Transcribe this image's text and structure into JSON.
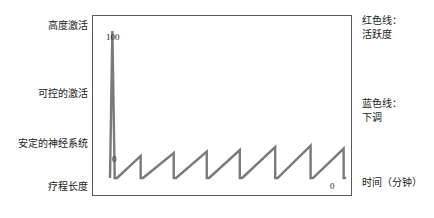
{
  "figure": {
    "title_visible": false,
    "background": "#ffffff",
    "frame_color": "#5a5a5a",
    "curve_color": "#7a7a7a"
  },
  "axis_labels": {
    "y_max": "100",
    "y_min": "0",
    "x_end": "0"
  },
  "left_labels": [
    {
      "text": "高度激活"
    },
    {
      "text": "可控的激活"
    },
    {
      "text": "安定的神经系统"
    },
    {
      "text": "疗程长度"
    }
  ],
  "right_labels": [
    {
      "text": "红色线：\n活跃度"
    },
    {
      "text": "蓝色线：\n下调"
    },
    {
      "text": "时间（分钟）"
    }
  ],
  "right_labels_flat": {
    "legend_red": "红色线：",
    "legend_red_value": "活跃度",
    "legend_blue": "蓝色线：",
    "legend_blue_value": "下调",
    "x_axis_title": "时间（分钟）"
  },
  "chart_data": {
    "type": "line",
    "title": "",
    "xlabel": "时间（分钟）",
    "ylabel": "",
    "ylim": [
      0,
      100
    ],
    "xlim": [
      0,
      100
    ],
    "grid": false,
    "legend_position": "right",
    "y_category_ticks": [
      "高度激活",
      "可控的激活",
      "安定的神经系统",
      "疗程长度"
    ],
    "y_tick_labels": [
      "0",
      "100"
    ],
    "x_tick_labels": [
      "0"
    ],
    "series": [
      {
        "name": "活跃度",
        "color": "#7a7a7a",
        "description": "初始尖峰后呈六次锯齿状升降，整体保持在低位",
        "points": [
          [
            0,
            0
          ],
          [
            1,
            100
          ],
          [
            2,
            0
          ],
          [
            3,
            0
          ],
          [
            13,
            15
          ],
          [
            13,
            0
          ],
          [
            14,
            0
          ],
          [
            27,
            17
          ],
          [
            27,
            0
          ],
          [
            28,
            0
          ],
          [
            41,
            18
          ],
          [
            41,
            0
          ],
          [
            42,
            0
          ],
          [
            55,
            19
          ],
          [
            55,
            0
          ],
          [
            56,
            0
          ],
          [
            70,
            21
          ],
          [
            70,
            0
          ],
          [
            71,
            0
          ],
          [
            85,
            22
          ],
          [
            85,
            0
          ],
          [
            86,
            0
          ],
          [
            99,
            20
          ],
          [
            99,
            0
          ],
          [
            100,
            0
          ]
        ]
      }
    ],
    "annotations": [
      {
        "text": "100",
        "x": 0,
        "y": 100
      },
      {
        "text": "0",
        "x": 0,
        "y": 0
      },
      {
        "text": "0",
        "x": 100,
        "y": 0
      }
    ]
  }
}
